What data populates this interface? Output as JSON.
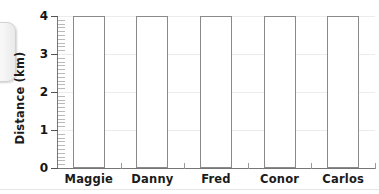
{
  "chart_data": {
    "type": "bar",
    "title": "",
    "xlabel": "",
    "ylabel": "Distance (km)",
    "categories": [
      "Maggie",
      "Danny",
      "Fred",
      "Conor",
      "Carlos"
    ],
    "values": [
      4,
      4,
      4,
      4,
      4
    ],
    "ylim": [
      0,
      4
    ],
    "ytick_labels": [
      "0",
      "1",
      "2",
      "3",
      "4"
    ],
    "ytick_values": [
      0,
      1,
      2,
      3,
      4
    ],
    "minor_tick_step": 0.1,
    "grid": "horizontal-light",
    "legend": "none",
    "bar_style": "outlined-unfilled",
    "colors": {
      "bar_outline": "#8a8a8a",
      "bar_fill": "#ffffff",
      "axis": "#767676",
      "gridline": "#ececec",
      "text": "#1b1b1b",
      "background": "#ffffff",
      "edge_tab": "#efefef"
    }
  },
  "decorations": {
    "edge_tab_name": "page-edge-tab"
  }
}
